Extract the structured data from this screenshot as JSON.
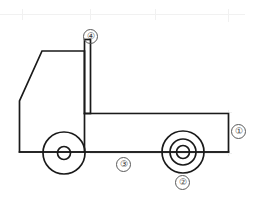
{
  "figure": {
    "background_color": "#ffffff",
    "stroke_color": "#1a1a1a",
    "grid_color": "#f0f0f0",
    "callout_color": "#5a5a5a",
    "width": 259,
    "height": 202
  },
  "grid": {
    "visible": true,
    "horizontal_lines": [
      14
    ],
    "vertical_ticks": [
      22,
      90,
      155,
      228
    ]
  },
  "callouts": [
    {
      "id": "callout-1",
      "label": "①",
      "number": "1",
      "x": 231,
      "y": 124,
      "target": "rear-bed-end-panel"
    },
    {
      "id": "callout-2",
      "label": "②",
      "number": "2",
      "x": 175,
      "y": 175,
      "target": "rear-wheel"
    },
    {
      "id": "callout-3",
      "label": "③",
      "number": "3",
      "x": 116,
      "y": 157,
      "target": "chassis-frame-rail"
    },
    {
      "id": "callout-4",
      "label": "④",
      "number": "4",
      "x": 83,
      "y": 29,
      "target": "headboard-post"
    }
  ],
  "parts": {
    "cab": "truck-cab",
    "headboard": "headboard-post",
    "bed": "flatbed-platform",
    "frame": "chassis-frame-rail",
    "front_wheel": "front-wheel",
    "rear_wheel": "rear-wheel"
  }
}
